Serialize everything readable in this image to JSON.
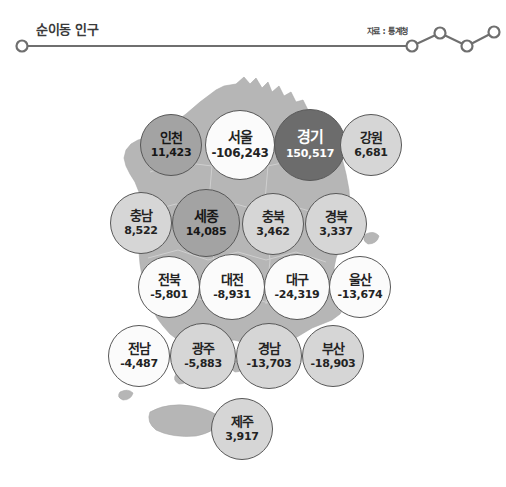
{
  "header": {
    "title": "순이동 인구",
    "source": "자료 : 통계청",
    "line_icon": "sparkline-icon",
    "accent_color": "#6f6f6f"
  },
  "map": {
    "region_name": "대한민국",
    "land_color": "#b6b6b6",
    "border_color": "#8c8c8c",
    "background_color": "#ffffff"
  },
  "chart_data": {
    "type": "bubble-map",
    "title": "순이동 인구",
    "subtitle": "자료 : 통계청",
    "unit": "명",
    "xlabel": "",
    "ylabel": "",
    "legend": [],
    "categories": [
      "인천",
      "서울",
      "경기",
      "강원",
      "충남",
      "세종",
      "충북",
      "경북",
      "전북",
      "대전",
      "대구",
      "울산",
      "전남",
      "광주",
      "경남",
      "부산",
      "제주"
    ],
    "values": [
      11423,
      -106243,
      150517,
      6681,
      8522,
      14085,
      3462,
      3337,
      -5801,
      -8931,
      -24319,
      -13674,
      -4487,
      -5883,
      -13703,
      -18903,
      3917
    ],
    "regions": [
      {
        "name": "인천",
        "value": "11,423",
        "number": 11423,
        "tone": "mid",
        "x": 140,
        "y": 52,
        "size": 62,
        "name_size": 13,
        "val_size": 11
      },
      {
        "name": "서울",
        "value": "-106,243",
        "number": -106243,
        "tone": "white",
        "x": 205,
        "y": 48,
        "size": 70,
        "name_size": 14,
        "val_size": 12
      },
      {
        "name": "경기",
        "value": "150,517",
        "number": 150517,
        "tone": "dark",
        "x": 274,
        "y": 47,
        "size": 72,
        "name_size": 15,
        "val_size": 11
      },
      {
        "name": "강원",
        "value": "6,681",
        "number": 6681,
        "tone": "light",
        "x": 340,
        "y": 52,
        "size": 62,
        "name_size": 13,
        "val_size": 11
      },
      {
        "name": "충남",
        "value": "8,522",
        "number": 8522,
        "tone": "light",
        "x": 110,
        "y": 130,
        "size": 62,
        "name_size": 13,
        "val_size": 11
      },
      {
        "name": "세종",
        "value": "14,085",
        "number": 14085,
        "tone": "mid",
        "x": 172,
        "y": 127,
        "size": 68,
        "name_size": 14,
        "val_size": 11
      },
      {
        "name": "충북",
        "value": "3,462",
        "number": 3462,
        "tone": "light",
        "x": 242,
        "y": 131,
        "size": 62,
        "name_size": 13,
        "val_size": 11
      },
      {
        "name": "경북",
        "value": "3,337",
        "number": 3337,
        "tone": "light",
        "x": 305,
        "y": 131,
        "size": 62,
        "name_size": 13,
        "val_size": 11
      },
      {
        "name": "전북",
        "value": "-5,801",
        "number": -5801,
        "tone": "white",
        "x": 138,
        "y": 194,
        "size": 62,
        "name_size": 13,
        "val_size": 11
      },
      {
        "name": "대전",
        "value": "-8,931",
        "number": -8931,
        "tone": "white",
        "x": 199,
        "y": 192,
        "size": 66,
        "name_size": 13,
        "val_size": 11
      },
      {
        "name": "대구",
        "value": "-24,319",
        "number": -24319,
        "tone": "white",
        "x": 264,
        "y": 192,
        "size": 66,
        "name_size": 13,
        "val_size": 11
      },
      {
        "name": "울산",
        "value": "-13,674",
        "number": -13674,
        "tone": "white",
        "x": 329,
        "y": 194,
        "size": 62,
        "name_size": 13,
        "val_size": 11
      },
      {
        "name": "전남",
        "value": "-4,487",
        "number": -4487,
        "tone": "white",
        "x": 108,
        "y": 263,
        "size": 62,
        "name_size": 13,
        "val_size": 11
      },
      {
        "name": "광주",
        "value": "-5,883",
        "number": -5883,
        "tone": "light",
        "x": 170,
        "y": 261,
        "size": 66,
        "name_size": 13,
        "val_size": 11
      },
      {
        "name": "경남",
        "value": "-13,703",
        "number": -13703,
        "tone": "light",
        "x": 236,
        "y": 261,
        "size": 66,
        "name_size": 13,
        "val_size": 11
      },
      {
        "name": "부산",
        "value": "-18,903",
        "number": -18903,
        "tone": "light",
        "x": 302,
        "y": 263,
        "size": 62,
        "name_size": 13,
        "val_size": 11
      },
      {
        "name": "제주",
        "value": "3,917",
        "number": 3917,
        "tone": "light",
        "x": 211,
        "y": 336,
        "size": 62,
        "name_size": 13,
        "val_size": 11
      }
    ]
  }
}
